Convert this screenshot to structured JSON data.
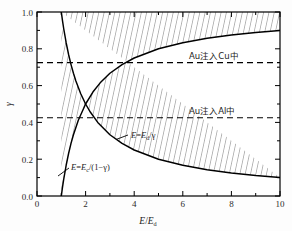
{
  "figure": {
    "background": "#fdfdfd",
    "frame_color": "#000000",
    "curve_color": "#000000",
    "dash_color": "#000000",
    "hatch_color": "#555555"
  },
  "chart_data": {
    "type": "line",
    "title": "",
    "xlabel": "E/E_d",
    "ylabel": "γ",
    "xlim": [
      0,
      10
    ],
    "ylim": [
      0,
      1.0
    ],
    "grid": false,
    "legend_position": "none",
    "xticks": [
      0,
      2,
      4,
      6,
      8,
      10
    ],
    "xtick_labels": [
      "0",
      "2",
      "4",
      "6",
      "8",
      "10"
    ],
    "xticks_minor": [
      1,
      3,
      5,
      7,
      9
    ],
    "yticks": [
      0.0,
      0.2,
      0.4,
      0.6,
      0.8,
      1.0
    ],
    "ytick_labels": [
      "0.0",
      "0.2",
      "0.4",
      "0.6",
      "0.8",
      "1.0"
    ],
    "yticks_minor": [
      0.1,
      0.3,
      0.5,
      0.7,
      0.9
    ],
    "series": [
      {
        "name": "E = E_d/γ",
        "equation": "x = 1/y",
        "style": "solid",
        "points": [
          [
            1.0,
            1.0
          ],
          [
            1.05,
            0.952
          ],
          [
            1.1,
            0.909
          ],
          [
            1.2,
            0.833
          ],
          [
            1.3,
            0.769
          ],
          [
            1.4,
            0.714
          ],
          [
            1.5,
            0.667
          ],
          [
            1.6,
            0.625
          ],
          [
            1.8,
            0.556
          ],
          [
            2.0,
            0.5
          ],
          [
            2.2,
            0.455
          ],
          [
            2.5,
            0.4
          ],
          [
            3.0,
            0.333
          ],
          [
            3.5,
            0.286
          ],
          [
            4.0,
            0.25
          ],
          [
            5.0,
            0.2
          ],
          [
            6.0,
            0.167
          ],
          [
            7.0,
            0.143
          ],
          [
            8.0,
            0.125
          ],
          [
            9.0,
            0.111
          ],
          [
            10.0,
            0.1
          ]
        ]
      },
      {
        "name": "E = E_c/(1−γ)",
        "equation": "x = 1/(1-y)",
        "style": "solid",
        "points": [
          [
            1.0,
            0.0
          ],
          [
            1.05,
            0.048
          ],
          [
            1.1,
            0.091
          ],
          [
            1.2,
            0.167
          ],
          [
            1.3,
            0.231
          ],
          [
            1.4,
            0.286
          ],
          [
            1.5,
            0.333
          ],
          [
            1.7,
            0.412
          ],
          [
            2.0,
            0.5
          ],
          [
            2.3,
            0.565
          ],
          [
            2.6,
            0.615
          ],
          [
            3.0,
            0.667
          ],
          [
            3.5,
            0.714
          ],
          [
            4.0,
            0.75
          ],
          [
            5.0,
            0.8
          ],
          [
            6.0,
            0.833
          ],
          [
            7.0,
            0.857
          ],
          [
            8.0,
            0.875
          ],
          [
            9.0,
            0.889
          ],
          [
            10.0,
            0.9
          ]
        ]
      }
    ],
    "hatched_region": {
      "description": "Region between E=E_c/(1-γ) curve and E=E_d/γ curve, above both",
      "hatch_style": "near-vertical lines"
    },
    "reference_lines": [
      {
        "label": "Au注入Cu中",
        "value": 0.725,
        "style": "dashed",
        "orientation": "horizontal"
      },
      {
        "label": "Au注入Al中",
        "value": 0.425,
        "style": "dashed",
        "orientation": "horizontal"
      }
    ],
    "annotations": [
      {
        "name": "curve-label-ed",
        "text_parts": [
          "E",
          "=",
          "E",
          "d",
          "/",
          "γ"
        ],
        "x": 3.9,
        "y": 0.315
      },
      {
        "name": "curve-label-ec",
        "text_parts": [
          "E",
          "=",
          "E",
          "c",
          "/(1−",
          "γ",
          ")"
        ],
        "x": 1.65,
        "y": 0.155
      }
    ]
  },
  "labels": {
    "y_axis": "γ",
    "x_axis_num": "E",
    "x_axis_den": "E",
    "x_axis_den_sub": "d",
    "x_axis_slash": "/",
    "anno_cu": "Au注入Cu中",
    "anno_al": "Au注入Al中",
    "curve_ed_e1": "E",
    "curve_ed_eq": "=",
    "curve_ed_e2": "E",
    "curve_ed_sub": "d",
    "curve_ed_tail": "/γ",
    "curve_ec_e1": "E",
    "curve_ec_eq": "=",
    "curve_ec_e2": "E",
    "curve_ec_sub": "c",
    "curve_ec_tail": "/(1−γ)",
    "ytick_0": "0.0",
    "ytick_1": "0.2",
    "ytick_2": "0.4",
    "ytick_3": "0.6",
    "ytick_4": "0.8",
    "ytick_5": "1.0",
    "xtick_0": "0",
    "xtick_1": "2",
    "xtick_2": "4",
    "xtick_3": "6",
    "xtick_4": "8",
    "xtick_5": "10"
  }
}
